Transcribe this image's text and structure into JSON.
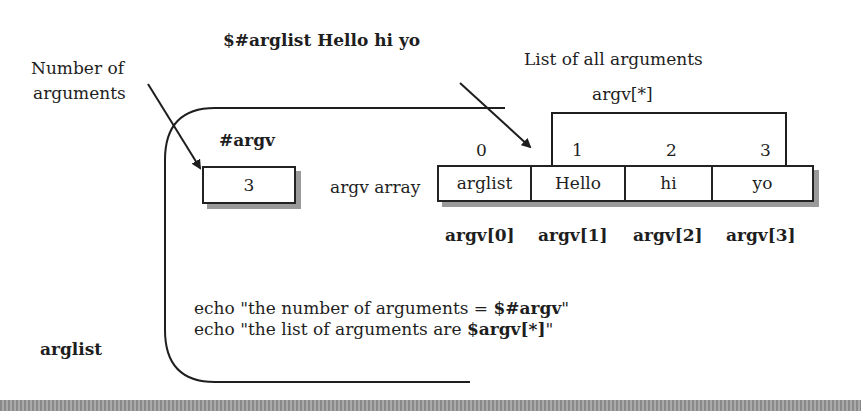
{
  "labels": {
    "command": "$#arglist Hello hi yo",
    "number_of_arguments_line1": "Number of",
    "number_of_arguments_line2": "arguments",
    "list_of_all_arguments": "List of all arguments",
    "argv_star": "argv[*]",
    "hash_argv": "#argv",
    "argv_array": "argv array",
    "script_name": "arglist"
  },
  "count_box": {
    "value": "3"
  },
  "array": {
    "indices": [
      "0",
      "1",
      "2",
      "3"
    ],
    "cells": [
      "arglist",
      "Hello",
      "hi",
      "yo"
    ],
    "names": [
      "argv[0]",
      "argv[1]",
      "argv[2]",
      "argv[3]"
    ]
  },
  "code": {
    "line1_prefix": "echo \"the number of arguments = ",
    "line1_bold": "$#argv",
    "line1_suffix": "\"",
    "line2_prefix": "echo \"the list of arguments are ",
    "line2_bold": "$argv[*]",
    "line2_suffix": "\""
  },
  "colors": {
    "ink": "#1e1e1e",
    "shadow": "#9a9a9a",
    "background": "#ffffff"
  }
}
